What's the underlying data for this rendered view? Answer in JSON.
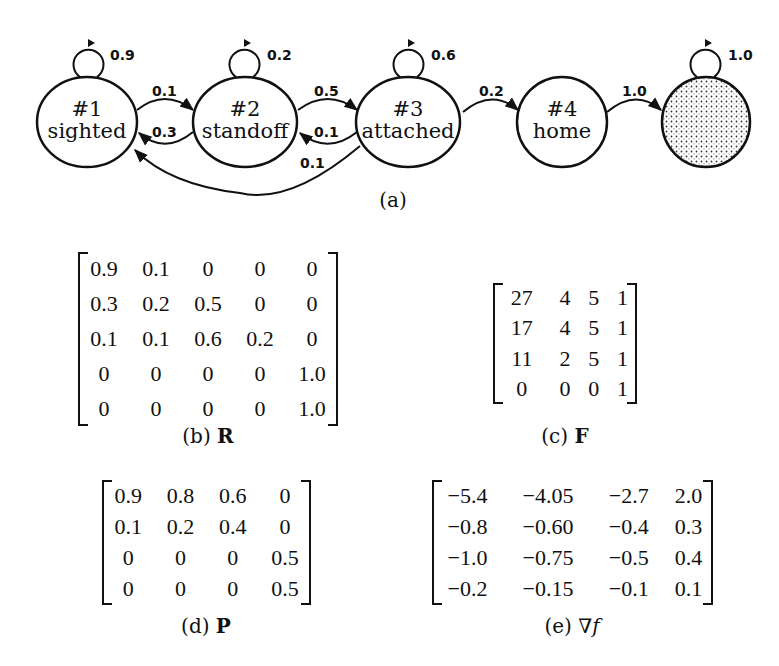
{
  "figure_a": {
    "caption": "(a)",
    "nodes": [
      {
        "id": "1",
        "number": "#1",
        "name": "sighted",
        "self_loop": "0.9"
      },
      {
        "id": "2",
        "number": "#2",
        "name": "standoff",
        "self_loop": "0.2"
      },
      {
        "id": "3",
        "number": "#3",
        "name": "attached",
        "self_loop": "0.6"
      },
      {
        "id": "4",
        "number": "#4",
        "name": "home",
        "self_loop": ""
      },
      {
        "id": "5",
        "number": "",
        "name": "",
        "self_loop": "1.0",
        "style": "dotted-absorbing"
      }
    ],
    "edges": [
      {
        "from": "1",
        "to": "2",
        "label": "0.1"
      },
      {
        "from": "2",
        "to": "1",
        "label": "0.3"
      },
      {
        "from": "2",
        "to": "3",
        "label": "0.5"
      },
      {
        "from": "3",
        "to": "2",
        "label": "0.1"
      },
      {
        "from": "3",
        "to": "1",
        "label": "0.1"
      },
      {
        "from": "3",
        "to": "4",
        "label": "0.2"
      },
      {
        "from": "4",
        "to": "5",
        "label": "1.0"
      }
    ]
  },
  "matrices": {
    "R": {
      "caption_prefix": "(b)",
      "symbol": "R",
      "rows": [
        [
          "0.9",
          "0.1",
          "0",
          "0",
          "0"
        ],
        [
          "0.3",
          "0.2",
          "0.5",
          "0",
          "0"
        ],
        [
          "0.1",
          "0.1",
          "0.6",
          "0.2",
          "0"
        ],
        [
          "0",
          "0",
          "0",
          "0",
          "1.0"
        ],
        [
          "0",
          "0",
          "0",
          "0",
          "1.0"
        ]
      ]
    },
    "F": {
      "caption_prefix": "(c)",
      "symbol": "F",
      "rows": [
        [
          "27",
          "4",
          "5",
          "1"
        ],
        [
          "17",
          "4",
          "5",
          "1"
        ],
        [
          "11",
          "2",
          "5",
          "1"
        ],
        [
          "0",
          "0",
          "0",
          "1"
        ]
      ]
    },
    "P": {
      "caption_prefix": "(d)",
      "symbol": "P",
      "rows": [
        [
          "0.9",
          "0.8",
          "0.6",
          "0"
        ],
        [
          "0.1",
          "0.2",
          "0.4",
          "0"
        ],
        [
          "0",
          "0",
          "0",
          "0.5"
        ],
        [
          "0",
          "0",
          "0",
          "0.5"
        ]
      ]
    },
    "gradF": {
      "caption_prefix": "(e)",
      "symbol": "∇f",
      "rows": [
        [
          "−5.4",
          "−4.05",
          "−2.7",
          "2.0"
        ],
        [
          "−0.8",
          "−0.60",
          "−0.4",
          "0.3"
        ],
        [
          "−1.0",
          "−0.75",
          "−0.5",
          "0.4"
        ],
        [
          "−0.2",
          "−0.15",
          "−0.1",
          "0.1"
        ]
      ]
    }
  }
}
